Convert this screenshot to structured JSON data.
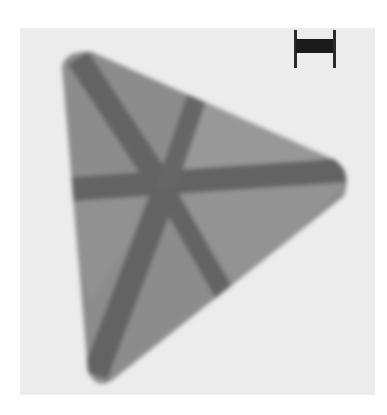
{
  "image": {
    "description": "Micrograph of a triangular nanoplate with dark radiating contrast bands crossing at the center",
    "background_color": "#ececec",
    "particle_color": "#8a8a8a",
    "band_color": "#626262",
    "scale_bar": {
      "label": "",
      "color": "#1a1a1a"
    }
  }
}
